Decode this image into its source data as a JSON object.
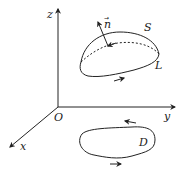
{
  "diagram": {
    "type": "vector-calculus-stokes-theorem",
    "axes": {
      "origin_label": "O",
      "x_label": "x",
      "y_label": "y",
      "z_label": "z"
    },
    "surface": {
      "label": "S",
      "boundary_label": "L",
      "normal_label": "n",
      "normal_arrow_glyph": "→"
    },
    "region": {
      "label": "D"
    },
    "colors": {
      "stroke": "#222222",
      "background": "#ffffff"
    }
  }
}
